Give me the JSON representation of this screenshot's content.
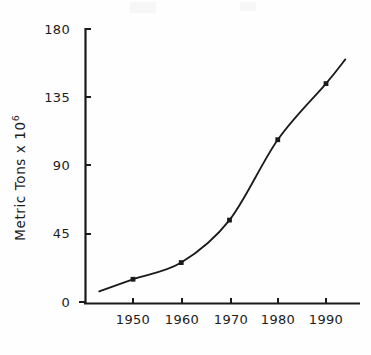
{
  "chart_data": {
    "type": "line",
    "title": "",
    "subtitle": "",
    "xlabel": "",
    "ylabel": "Metric Tons x 10⁶",
    "ylabel_base": "Metric Tons x 10",
    "ylabel_exponent": "6",
    "xlim": [
      1943,
      1996
    ],
    "ylim": [
      0,
      180
    ],
    "grid": false,
    "legend": null,
    "legend_position": "none",
    "x_ticks": [
      1950,
      1960,
      1970,
      1980,
      1990
    ],
    "x_tick_labels": [
      "1950",
      "1960",
      "1970",
      "1980",
      "1990"
    ],
    "y_ticks": [
      0,
      45,
      90,
      135,
      180
    ],
    "y_tick_labels": [
      "0",
      "45",
      "90",
      "135",
      "180"
    ],
    "marker_style": "filled-square",
    "line_color": "#1a1a1a",
    "axis_color": "#1a1a1a",
    "background_color": "#fefefe",
    "series": [
      {
        "name": "World production",
        "x": [
          1943,
          1950,
          1960,
          1970,
          1980,
          1990,
          1994
        ],
        "values": [
          7,
          15,
          26,
          54,
          107,
          144,
          160
        ],
        "markers": [
          false,
          true,
          true,
          true,
          true,
          true,
          false
        ]
      }
    ],
    "data_points": [
      {
        "x": 1943,
        "y": 7,
        "marker": false
      },
      {
        "x": 1950,
        "y": 15,
        "marker": true
      },
      {
        "x": 1960,
        "y": 26,
        "marker": true
      },
      {
        "x": 1970,
        "y": 54,
        "marker": true
      },
      {
        "x": 1980,
        "y": 107,
        "marker": true
      },
      {
        "x": 1990,
        "y": 144,
        "marker": true
      },
      {
        "x": 1994,
        "y": 160,
        "marker": false
      }
    ]
  },
  "axes": {
    "y_axis_name": "y-axis",
    "x_axis_name": "x-axis"
  }
}
